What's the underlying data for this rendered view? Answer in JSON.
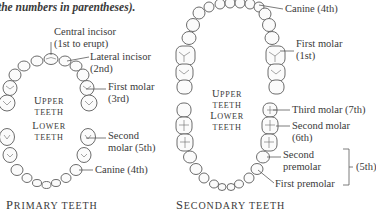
{
  "caption": "the numbers in parentheses).",
  "primary": {
    "title_first": "P",
    "title_rest": "RIMARY TEETH",
    "upper_first": "U",
    "upper_rest": "PPER",
    "upper_line2": "TEETH",
    "lower_first": "L",
    "lower_rest": "OWER",
    "lower_line2": "TEETH",
    "labels": {
      "central_incisor_1": "Central incisor",
      "central_incisor_2": "(1st to erupt)",
      "lateral_incisor_1": "Lateral incisor",
      "lateral_incisor_2": "(2nd)",
      "first_molar_1": "First molar",
      "first_molar_2": "(3rd)",
      "second_molar_1": "Second",
      "second_molar_2": "molar (5th)",
      "canine": "Canine (4th)"
    }
  },
  "secondary": {
    "title_first": "S",
    "title_rest": "ECONDARY TEETH",
    "upper_first": "U",
    "upper_rest": "PPER",
    "upper_line2": "TEETH",
    "lower_first": "L",
    "lower_rest": "OWER",
    "lower_line2": "TEETH",
    "labels": {
      "canine": "Canine (4th)",
      "first_molar_1": "First molar",
      "first_molar_2": "(1st)",
      "third_molar": "Third molar (7th)",
      "second_molar_1": "Second molar",
      "second_molar_2": "(6th)",
      "second_premolar_1": "Second",
      "second_premolar_2": "premolar",
      "first_premolar": "First premolar",
      "premolars_order": "(5th)"
    }
  }
}
